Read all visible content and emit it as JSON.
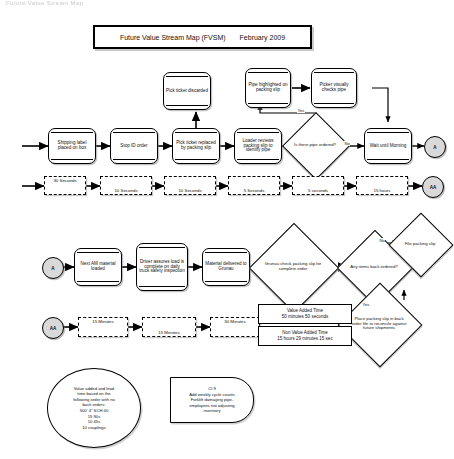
{
  "page": {
    "header_faint": "Future Value Stream Map",
    "title_label": "Future Value Stream Map (FVSM)",
    "title_date": "February 2009"
  },
  "row1": {
    "nodes": [
      {
        "id": "shipping-label",
        "label": "Shipping label placed on box"
      },
      {
        "id": "stop-id-order",
        "label": "Stop ID order"
      },
      {
        "id": "pick-ticket-replaced",
        "label": "Pick ticket replaced by packing slip"
      },
      {
        "id": "loader-reviews",
        "label": "Loader reviews packing slip to identify pipe"
      },
      {
        "id": "wait-until-morning",
        "label": "Wait until Morning"
      }
    ],
    "pick_ticket_discarded": "Pick ticket discarded",
    "pipe_highlighted": "Pipe highlighted on packing slip",
    "picker_checks": "Picker visually checks pipe",
    "decision": "Is there pipe ordered?",
    "yes_label": "Yes",
    "no_label": "No",
    "connector": "A"
  },
  "timeline1": {
    "connector": "AA",
    "boxes": [
      "30 Seconds",
      "10 Seconds",
      "10 Seconds",
      "5 Seconds",
      "5 seconds",
      "15 hours"
    ]
  },
  "row2": {
    "connector_in": "A",
    "nodes": [
      {
        "id": "next-am-material",
        "label": "Next AM material loaded"
      },
      {
        "id": "driver-assures",
        "label": "Driver assures load is complete on daily truck safety inspection"
      },
      {
        "id": "material-delivered",
        "label": "Material delivered to Grunau"
      }
    ],
    "decision_check": "Grunau check packing slip for complete order",
    "decision_backorder": "Any items back ordered?",
    "file_packing_slip": "File packing slip",
    "place_packing_slip": "Place packing slip in back order file to reconcile against future shipments",
    "no_label": "No",
    "yes_label": "Yes"
  },
  "timeline2": {
    "connector": "AA",
    "boxes": [
      "15 Minutes",
      "15 Minutes",
      "30 Minutes"
    ]
  },
  "summary": {
    "value_added_title": "Value Added Time",
    "value_added_value": "50 minutes 50 seconds",
    "non_value_added_title": "Non Value Added Time",
    "non_value_added_value": "15 hours 29 minutes 15 sec"
  },
  "info_circle": {
    "lines": [
      "Value added and lead",
      "time based on the",
      "following order with no",
      "back orders:",
      "500' 4\" SCH 40",
      "15 90s",
      "10 45s",
      "10 couplings"
    ]
  },
  "note": {
    "lines": [
      "CI 9",
      "Add weekly cycle counts",
      "Forklift damaging pipe-",
      "employees not adjusting",
      "inventory"
    ]
  },
  "colors": {
    "stroke": "#000000",
    "connector_fill": "#d9d9d9",
    "background": "#ffffff"
  }
}
